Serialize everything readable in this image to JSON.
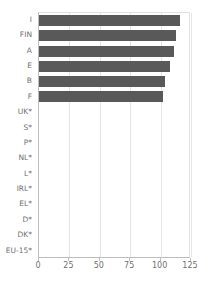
{
  "chart_data": {
    "type": "bar",
    "orientation": "horizontal",
    "title": "",
    "subtitle": "",
    "xlabel": "",
    "ylabel": "",
    "xlim": [
      0,
      125
    ],
    "xticks": [
      0,
      25,
      50,
      75,
      100,
      125
    ],
    "xticklabels": [
      "0",
      "25",
      "50",
      "75",
      "100",
      "125"
    ],
    "grid": true,
    "grid_axis": "x",
    "legend": false,
    "legend_position": "none",
    "bar_color": "#595959",
    "gridline_color": "#e6e6e6",
    "axis_color": "#bdbdbd",
    "text_color": "#6f6f6f",
    "categories": [
      "I",
      "FIN",
      "A",
      "E",
      "B",
      "F",
      "UK*",
      "S*",
      "P*",
      "NL*",
      "L*",
      "IRL*",
      "EL*",
      "D*",
      "DK*",
      "EU-15*"
    ],
    "values": [
      116,
      113,
      111,
      108,
      104,
      102,
      0,
      0,
      0,
      0,
      0,
      0,
      0,
      0,
      0,
      0
    ],
    "annotations": []
  }
}
